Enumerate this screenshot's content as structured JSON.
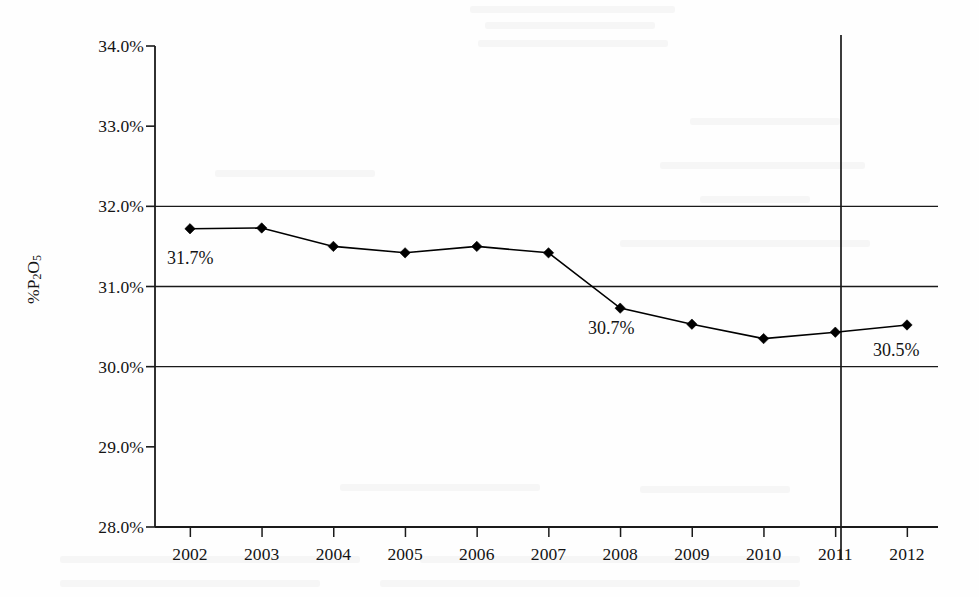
{
  "chart_data": {
    "type": "line",
    "title": "",
    "subtitle": "",
    "xlabel": "",
    "ylabel": "%P2O5",
    "ylabel_html": "%P<sub>2</sub>O<sub>5</sub>",
    "categories": [
      "2002",
      "2003",
      "2004",
      "2005",
      "2006",
      "2007",
      "2008",
      "2009",
      "2010",
      "2011",
      "2012"
    ],
    "x": [
      2002,
      2003,
      2004,
      2005,
      2006,
      2007,
      2008,
      2009,
      2010,
      2011,
      2012
    ],
    "series": [
      {
        "name": "%P2O5",
        "values": [
          31.72,
          31.73,
          31.5,
          31.42,
          31.5,
          31.42,
          30.73,
          30.53,
          30.35,
          30.43,
          30.52
        ],
        "color": "#000000",
        "marker": "diamond",
        "line_width": 1.6
      }
    ],
    "ylim": [
      28.0,
      34.0
    ],
    "ytick_values": [
      34.0,
      33.0,
      32.0,
      31.0,
      30.0,
      29.0,
      28.0
    ],
    "ytick_labels": [
      "34.0%",
      "33.0%",
      "32.0%",
      "31.0%",
      "30.0%",
      "29.0%",
      "28.0%"
    ],
    "gridlines_y": [
      32.0,
      31.0,
      30.0
    ],
    "grid": "horizontal-partial",
    "legend": "none",
    "legend_position": "none",
    "vertical_marker_line_at": "2011",
    "annotations": [
      {
        "text": "31.7%",
        "x_category": "2002",
        "value": 31.7,
        "left": 167,
        "top": 249
      },
      {
        "text": "30.7%",
        "x_category": "2008",
        "value": 30.7,
        "left": 588,
        "top": 319
      },
      {
        "text": "30.5%",
        "x_category": "2012",
        "value": 30.5,
        "left": 873,
        "top": 341
      }
    ]
  }
}
